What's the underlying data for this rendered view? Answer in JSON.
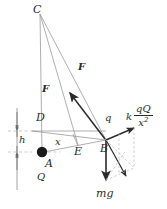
{
  "figure": {
    "type": "physics-force-diagram",
    "width": 167,
    "height": 209,
    "ink_color": "#2b2b2b",
    "line_color": "#8a8a8a",
    "dash_color": "#b0b0b0",
    "background": "#ffffff"
  },
  "points": {
    "C": {
      "label": "C",
      "x": 38,
      "y": 12
    },
    "D": {
      "label": "D",
      "x": 40,
      "y": 120
    },
    "A": {
      "label": "A",
      "x": 48,
      "y": 155
    },
    "E": {
      "label": "E",
      "x": 78,
      "y": 148
    },
    "B": {
      "label": "B",
      "x": 106,
      "y": 140
    }
  },
  "labels": {
    "force_vertical": "F",
    "force_diagonal": "F",
    "charge_q": "q",
    "charge_Q": "Q",
    "distance_x": "x",
    "height_h": "h",
    "weight": "mg",
    "coulomb_k": "k",
    "coulomb_numerator": "qQ",
    "coulomb_denominator_base": "x",
    "coulomb_denominator_exp": "2"
  },
  "vectors": [
    {
      "name": "tension-force-F",
      "label": "F",
      "from": "B",
      "direction": "up-left toward C"
    },
    {
      "name": "coulomb-force",
      "label": "k qQ / x2",
      "from": "B",
      "direction": "up-right"
    },
    {
      "name": "weight-force",
      "label": "mg",
      "from": "B",
      "direction": "straight down"
    },
    {
      "name": "resultant-force",
      "label": "",
      "from": "B",
      "direction": "down-right (dashed parallelogram resultant)"
    }
  ]
}
